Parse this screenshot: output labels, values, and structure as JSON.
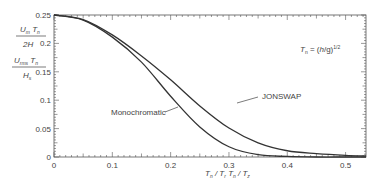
{
  "chart_data": {
    "type": "line",
    "title": "",
    "xlabel": "T_n / T_r   T_n / T_z",
    "ylabel_top": {
      "numerator": "U_m T_n",
      "denominator": "2H"
    },
    "ylabel_bottom": {
      "numerator": "U_rms T_n",
      "denominator": "H_s"
    },
    "annotation": "T_n = (h/g)^1/2",
    "xlim": [
      0,
      0.535
    ],
    "ylim": [
      0,
      0.25
    ],
    "xticks": [
      "0",
      "0.1",
      "0.2",
      "0.3",
      "0.4",
      "0.5"
    ],
    "yticks": [
      "0",
      "0.05",
      "0.1",
      "0.15",
      "0.2",
      "0.25"
    ],
    "grid": false,
    "series": [
      {
        "name": "Monochromatic",
        "x": [
          0,
          0.05,
          0.1,
          0.15,
          0.2,
          0.25,
          0.3,
          0.35,
          0.4,
          0.45,
          0.5,
          0.535
        ],
        "y": [
          0.25,
          0.241,
          0.211,
          0.167,
          0.107,
          0.053,
          0.018,
          0.004,
          0.001,
          0.0,
          0.0,
          0.0
        ]
      },
      {
        "name": "JONSWAP",
        "x": [
          0,
          0.05,
          0.1,
          0.15,
          0.2,
          0.25,
          0.3,
          0.35,
          0.4,
          0.45,
          0.5,
          0.535
        ],
        "y": [
          0.25,
          0.242,
          0.215,
          0.178,
          0.136,
          0.09,
          0.051,
          0.025,
          0.011,
          0.006,
          0.003,
          0.002
        ]
      }
    ]
  },
  "labels": {
    "monochromatic": "Monochromatic",
    "jonswap": "JONSWAP"
  }
}
